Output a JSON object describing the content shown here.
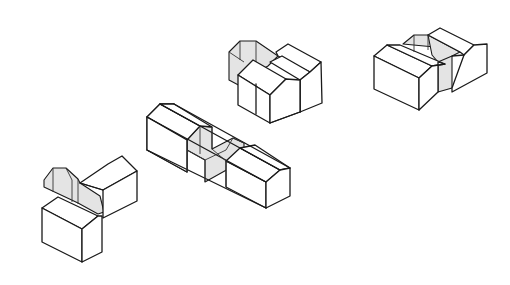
{
  "figure": {
    "background": "#ffffff",
    "line_color": "#1a1a1a",
    "shade_color": "#e4e4e4"
  },
  "assemblies": [
    {
      "id": "corner-assembly",
      "position": "bottom-left",
      "blocks": 3
    },
    {
      "id": "linear-assembly",
      "position": "center",
      "blocks": 3
    },
    {
      "id": "parallel-assembly",
      "position": "top-center",
      "blocks": 3
    },
    {
      "id": "twin-assembly",
      "position": "top-right",
      "blocks": 2
    }
  ]
}
